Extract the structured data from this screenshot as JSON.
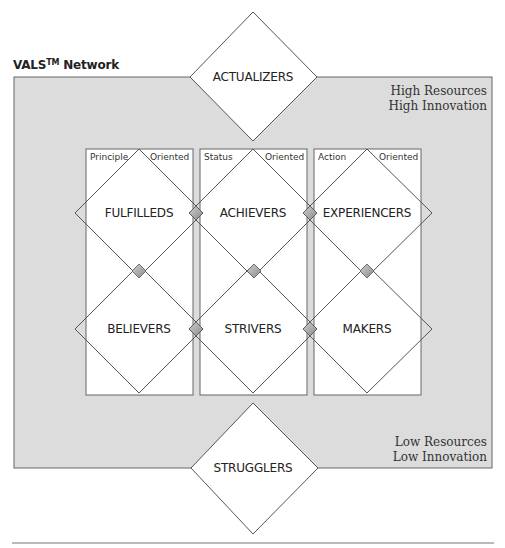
{
  "title": {
    "main": "VALS",
    "sup": "TM",
    "suffix": " Network"
  },
  "corners": {
    "top_right": [
      "High Resources",
      "High Innovation"
    ],
    "bottom_right": [
      "Low Resources",
      "Low Innovation"
    ]
  },
  "columns": [
    {
      "left": "Principle",
      "right": "Oriented"
    },
    {
      "left": "Status",
      "right": "Oriented"
    },
    {
      "left": "Action",
      "right": "Oriented"
    }
  ],
  "segments": {
    "top": "ACTUALIZERS",
    "bottom": "STRUGGLERS",
    "upper": [
      "FULFILLEDS",
      "ACHIEVERS",
      "EXPERIENCERS"
    ],
    "lower": [
      "BELIEVERS",
      "STRIVERS",
      "MAKERS"
    ]
  },
  "colors": {
    "panel": "#dcdcdc",
    "line": "#555555",
    "connector": "#a0a0a0"
  }
}
